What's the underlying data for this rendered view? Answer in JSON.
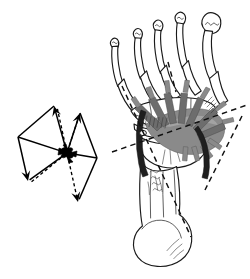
{
  "figure": {
    "caption": "",
    "background_color": "#ffffff",
    "ink_color": "#1a1a1a",
    "muscle_gray": "#8a8a8a",
    "muscle_gray_dark": "#6d6d6d",
    "muscle_gray_light": "#a3a3a3",
    "tendon_black": "#1f1f1f",
    "width": 250,
    "height": 279
  },
  "chart_data": {
    "type": "scatter",
    "xlabel": "",
    "ylabel": "",
    "origin": {
      "label": "",
      "x": 67,
      "y": 153
    },
    "series": [
      {
        "name": "solid-vectors",
        "style": "solid",
        "vectors": [
          {
            "name": "upper-left-solid",
            "from": [
              67,
              153
            ],
            "to": [
              54,
              106
            ],
            "arrowhead": true
          },
          {
            "name": "upper-right-solid",
            "from": [
              67,
              153
            ],
            "to": [
              80,
              113
            ],
            "arrowhead": true
          },
          {
            "name": "lower-left-solid",
            "from": [
              18,
              137
            ],
            "to": [
              28,
              181
            ],
            "arrowhead": true
          },
          {
            "name": "left-edge-upper",
            "from": [
              18,
              137
            ],
            "to": [
              54,
              106
            ],
            "arrowhead": false
          },
          {
            "name": "left-edge-hub",
            "from": [
              18,
              137
            ],
            "to": [
              67,
              153
            ],
            "arrowhead": false
          },
          {
            "name": "left-close",
            "from": [
              28,
              181
            ],
            "to": [
              67,
              153
            ],
            "arrowhead": false
          },
          {
            "name": "right-edge-upper",
            "from": [
              80,
              113
            ],
            "to": [
              97,
              158
            ],
            "arrowhead": false
          },
          {
            "name": "right-edge-hub",
            "from": [
              67,
              153
            ],
            "to": [
              97,
              158
            ],
            "arrowhead": false
          },
          {
            "name": "right-close",
            "from": [
              97,
              158
            ],
            "to": [
              78,
              202
            ],
            "arrowhead": false
          }
        ]
      },
      {
        "name": "dashed-vectors",
        "style": "dashed",
        "vectors": [
          {
            "name": "upper-left-dashed",
            "from": [
              67,
              153
            ],
            "to": [
              57,
              107
            ],
            "arrowhead": false
          },
          {
            "name": "upper-right-dashed",
            "from": [
              67,
              153
            ],
            "to": [
              79,
              116
            ],
            "arrowhead": false
          },
          {
            "name": "lower-left-dashed",
            "from": [
              67,
              153
            ],
            "to": [
              30,
              183
            ],
            "arrowhead": false
          },
          {
            "name": "lower-right-dashed",
            "from": [
              67,
              153
            ],
            "to": [
              78,
              202
            ],
            "arrowhead": true
          }
        ]
      }
    ],
    "grid": false,
    "legend": null,
    "annotations": []
  },
  "anatomy": {
    "view": "dorsal",
    "side": "right",
    "regions": [
      {
        "name": "distal-phalanges",
        "count": 5,
        "label": ""
      },
      {
        "name": "proximal-phalanges",
        "count": 5,
        "label": ""
      },
      {
        "name": "metatarsals",
        "count": 5,
        "label": ""
      },
      {
        "name": "tarsals",
        "count": 1,
        "label": ""
      },
      {
        "name": "calcaneus",
        "count": 1,
        "label": ""
      }
    ],
    "soft_tissue": [
      {
        "name": "muscle-fan",
        "color": "#8a8a8a"
      },
      {
        "name": "tendon-band",
        "color": "#1f1f1f"
      }
    ],
    "axis_lines": [
      {
        "name": "medial-axis-dashed",
        "from": [
          122,
          86
        ],
        "to": [
          191,
          237
        ]
      },
      {
        "name": "lateral-axis-dashed",
        "from": [
          242,
          116
        ],
        "to": [
          205,
          190
        ]
      },
      {
        "name": "oblique-axis-dashed",
        "from": [
          112,
          152
        ],
        "to": [
          247,
          105
        ]
      },
      {
        "name": "toe-axis-dashed",
        "from": [
          168,
          62
        ],
        "to": [
          176,
          92
        ]
      }
    ]
  }
}
